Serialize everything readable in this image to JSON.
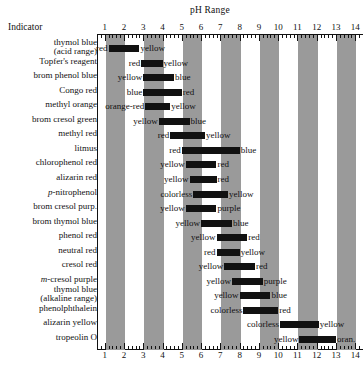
{
  "header": {
    "indicator_column_label": "Indicator",
    "ph_range_title": "pH Range"
  },
  "axis": {
    "ticks": [
      1,
      2,
      3,
      4,
      5,
      6,
      7,
      8,
      9,
      10,
      11,
      12,
      13,
      14
    ],
    "min": 0.6,
    "max": 14.4,
    "minor_per_unit": 5
  },
  "colors": {
    "band": "#9a9a9a",
    "bar": "#111111",
    "background": "#ffffff",
    "text": "#111111"
  },
  "bands": [
    {
      "from": 1,
      "to": 2
    },
    {
      "from": 3,
      "to": 4
    },
    {
      "from": 5,
      "to": 6
    },
    {
      "from": 7,
      "to": 8
    },
    {
      "from": 9,
      "to": 10
    },
    {
      "from": 11,
      "to": 12
    },
    {
      "from": 13,
      "to": 14
    }
  ],
  "chart_data": {
    "type": "bar",
    "title": "pH Range",
    "xlabel": "pH Range",
    "ylabel": "Indicator",
    "xlim": [
      0.6,
      14.4
    ],
    "grid": false,
    "legend": "none",
    "orientation": "horizontal-range",
    "categories": [
      "thymol blue (acid range)",
      "Topfer's reagent",
      "brom phenol blue",
      "Congo red",
      "methyl orange",
      "brom cresol green",
      "methyl red",
      "litmus",
      "chlorophenol red",
      "alizarin red",
      "p-nitrophenol",
      "brom cresol purp.",
      "brom thymol blue",
      "phenol red",
      "neutral red",
      "cresol red",
      "m-cresol purple",
      "thymol blue (alkaline range)",
      "phenolphthalein",
      "alizarin yellow",
      "tropeolin O"
    ],
    "rows": [
      {
        "name": "thymol blue",
        "name2": "(acid range)",
        "italic_prefix": "",
        "acid_color": "red",
        "base_color": "yellow",
        "ph_low": 1.2,
        "ph_high": 2.8
      },
      {
        "name": "Topfer's reagent",
        "name2": "",
        "italic_prefix": "",
        "acid_color": "red",
        "base_color": "yellow",
        "ph_low": 2.9,
        "ph_high": 4.0
      },
      {
        "name": "brom phenol blue",
        "name2": "",
        "italic_prefix": "",
        "acid_color": "yellow",
        "base_color": "blue",
        "ph_low": 3.0,
        "ph_high": 4.6
      },
      {
        "name": "Congo red",
        "name2": "",
        "italic_prefix": "",
        "acid_color": "blue",
        "base_color": "red",
        "ph_low": 3.0,
        "ph_high": 5.0
      },
      {
        "name": "methyl orange",
        "name2": "",
        "italic_prefix": "",
        "acid_color": "orange-red",
        "base_color": "yellow",
        "ph_low": 3.1,
        "ph_high": 4.4
      },
      {
        "name": "brom cresol green",
        "name2": "",
        "italic_prefix": "",
        "acid_color": "yellow",
        "base_color": "blue",
        "ph_low": 3.8,
        "ph_high": 5.4
      },
      {
        "name": "methyl red",
        "name2": "",
        "italic_prefix": "",
        "acid_color": "red",
        "base_color": "yellow",
        "ph_low": 4.4,
        "ph_high": 6.2
      },
      {
        "name": "litmus",
        "name2": "",
        "italic_prefix": "",
        "acid_color": "red",
        "base_color": "blue",
        "ph_low": 5.0,
        "ph_high": 8.0
      },
      {
        "name": "chlorophenol red",
        "name2": "",
        "italic_prefix": "",
        "acid_color": "yellow",
        "base_color": "red",
        "ph_low": 5.2,
        "ph_high": 6.8
      },
      {
        "name": "alizarin red",
        "name2": "",
        "italic_prefix": "",
        "acid_color": "yellow",
        "base_color": "red",
        "ph_low": 5.4,
        "ph_high": 6.8
      },
      {
        "name": "nitrophenol",
        "name2": "",
        "italic_prefix": "p-",
        "acid_color": "colorless",
        "base_color": "yellow",
        "ph_low": 5.6,
        "ph_high": 7.4
      },
      {
        "name": "brom cresol purp.",
        "name2": "",
        "italic_prefix": "",
        "acid_color": "yellow",
        "base_color": "purple",
        "ph_low": 5.2,
        "ph_high": 6.8
      },
      {
        "name": "brom thymol blue",
        "name2": "",
        "italic_prefix": "",
        "acid_color": "yellow",
        "base_color": "blue",
        "ph_low": 6.0,
        "ph_high": 7.6
      },
      {
        "name": "phenol red",
        "name2": "",
        "italic_prefix": "",
        "acid_color": "yellow",
        "base_color": "red",
        "ph_low": 6.8,
        "ph_high": 8.4
      },
      {
        "name": "neutral red",
        "name2": "",
        "italic_prefix": "",
        "acid_color": "red",
        "base_color": "yellow",
        "ph_low": 6.8,
        "ph_high": 8.0
      },
      {
        "name": "cresol red",
        "name2": "",
        "italic_prefix": "",
        "acid_color": "yellow",
        "base_color": "red",
        "ph_low": 7.2,
        "ph_high": 8.8
      },
      {
        "name": "cresol purple",
        "name2": "",
        "italic_prefix": "m-",
        "acid_color": "yellow",
        "base_color": "purple",
        "ph_low": 7.6,
        "ph_high": 9.2
      },
      {
        "name": "thymol blue",
        "name2": "(alkaline range)",
        "italic_prefix": "",
        "acid_color": "yellow",
        "base_color": "blue",
        "ph_low": 8.0,
        "ph_high": 9.6
      },
      {
        "name": "phenolphthalein",
        "name2": "",
        "italic_prefix": "",
        "acid_color": "colorless",
        "base_color": "red",
        "ph_low": 8.2,
        "ph_high": 10.0
      },
      {
        "name": "alizarin yellow",
        "name2": "",
        "italic_prefix": "",
        "acid_color": "colorless",
        "base_color": "yellow",
        "ph_low": 10.1,
        "ph_high": 12.1
      },
      {
        "name": "tropeolin O",
        "name2": "",
        "italic_prefix": "",
        "acid_color": "yellow",
        "base_color": "oran.",
        "ph_low": 11.1,
        "ph_high": 13.0
      }
    ]
  }
}
